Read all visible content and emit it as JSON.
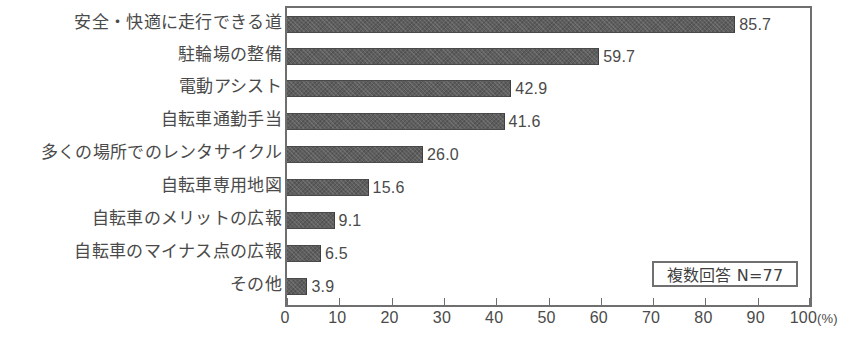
{
  "chart_data": {
    "type": "bar",
    "orientation": "horizontal",
    "title": "",
    "xlabel": "(%)",
    "ylabel": "",
    "xlim": [
      0,
      100
    ],
    "xticks": [
      0,
      10,
      20,
      30,
      40,
      50,
      60,
      70,
      80,
      90,
      100
    ],
    "xtick_labels": [
      "0",
      "10",
      "20",
      "30",
      "40",
      "50",
      "60",
      "70",
      "80",
      "90",
      "100"
    ],
    "unit_suffix": "(%)",
    "grid": false,
    "legend": null,
    "annotation": "複数回答 N=77",
    "categories": [
      "安全・快適に走行できる道",
      "駐輪場の整備",
      "電動アシスト",
      "自転車通勤手当",
      "多くの場所でのレンタサイクル",
      "自転車専用地図",
      "自転車のメリットの広報",
      "自転車のマイナス点の広報",
      "その他"
    ],
    "values": [
      85.7,
      59.7,
      42.9,
      41.6,
      26.0,
      15.6,
      9.1,
      6.5,
      3.9
    ],
    "value_labels": [
      "85.7",
      "59.7",
      "42.9",
      "41.6",
      "26.0",
      "15.6",
      "9.1",
      "6.5",
      "3.9"
    ],
    "bar_color": "#5e5e5e",
    "frame_color": "#6f6f6f",
    "background_color": "#ffffff"
  }
}
